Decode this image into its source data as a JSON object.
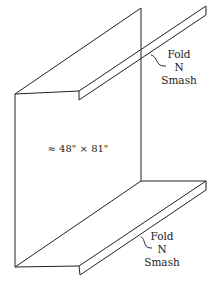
{
  "diagram": {
    "title": "",
    "dimension_label": "≈ 48\" × 81\"",
    "top_callout": {
      "line1": "Fold",
      "line2": "N",
      "line3": "Smash"
    },
    "bottom_callout": {
      "line1": "Fold",
      "line2": "N",
      "line3": "Smash"
    }
  }
}
